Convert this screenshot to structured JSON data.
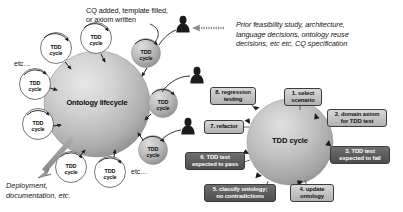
{
  "figure": {
    "annotations": {
      "cq_added": "CQ added, template filled,\nor axiom written",
      "prior_feasibility": "Prior feasibility study, architecture,\nlanguage decisions, ontology reuse\ndecisions, etc etc, CQ specification",
      "deployment": "Deployment,\ndocumentation, etc.",
      "etc_left": "etc…",
      "etc_bottom": "etc…"
    },
    "lifecycle": {
      "center_label": "Ontology lifecycle",
      "satellite_label": "TDD\ncycle",
      "satellites_outline_count": 6,
      "satellites_shaded_count": 3,
      "actor_icon": "person-silhouette-icon",
      "actor_count": 3
    },
    "tdd": {
      "center_label": "TDD cycle",
      "steps": [
        {
          "n": "1",
          "label": "1. select\nscenario",
          "style": "light"
        },
        {
          "n": "2",
          "label": "2. domain axiom\nfor TDD test",
          "style": "light"
        },
        {
          "n": "3",
          "label": "3. TDD test\nexpected to fail",
          "style": "dark"
        },
        {
          "n": "4",
          "label": "4. update\nontology",
          "style": "light"
        },
        {
          "n": "5",
          "label": "5. classify ontology;\nno contradictions",
          "style": "dark"
        },
        {
          "n": "6",
          "label": "6. TDD test\nexpected to pass",
          "style": "dark"
        },
        {
          "n": "7",
          "label": "7. refactor",
          "style": "light"
        },
        {
          "n": "8",
          "label": "8. regression\ntesting",
          "style": "light"
        }
      ]
    },
    "colors": {
      "background": "#ffffff",
      "text": "#151515",
      "sphere_light": "#dcdcdc",
      "sphere_mid": "#b8b8b8",
      "sphere_dark": "#8f8f8f",
      "step_light": "#c9c9c9",
      "step_dark": "#5c5c5c",
      "silhouette": "#1b1b1b",
      "stroke": "#3c3c3c"
    }
  }
}
